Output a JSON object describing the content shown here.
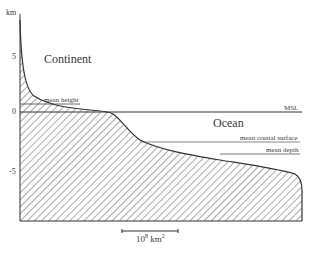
{
  "figure": {
    "y_axis": {
      "unit_label": "km",
      "ticks": [
        {
          "label": "5",
          "value": 5
        },
        {
          "label": "0",
          "value": 0
        },
        {
          "label": "-5",
          "value": -5
        }
      ]
    },
    "regions": {
      "continent_label": "Continent",
      "ocean_label": "Ocean"
    },
    "reference_lines": {
      "mean_height": "mean height",
      "msl": "MSL",
      "mean_crustal_surface": "mean crustal surface",
      "mean_depth": "mean depth"
    },
    "scale_bar": {
      "base": "10",
      "exponent": "8",
      "unit": "km",
      "unit_exponent": "2"
    }
  }
}
